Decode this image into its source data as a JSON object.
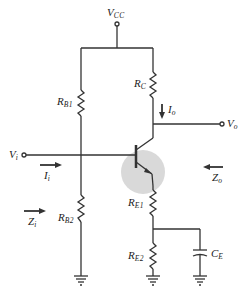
{
  "diagram": {
    "labels": {
      "vcc": {
        "main": "V",
        "sub": "CC"
      },
      "rb1": {
        "main": "R",
        "sub": "B1"
      },
      "rb2": {
        "main": "R",
        "sub": "B2"
      },
      "rc": {
        "main": "R",
        "sub": "C"
      },
      "re1": {
        "main": "R",
        "sub": "E1"
      },
      "re2": {
        "main": "R",
        "sub": "E2"
      },
      "ce": {
        "main": "C",
        "sub": "E"
      },
      "vi": {
        "main": "V",
        "sub": "i"
      },
      "vo": {
        "main": "V",
        "sub": "o"
      },
      "ii": {
        "main": "I",
        "sub": "i"
      },
      "io": {
        "main": "I",
        "sub": "o"
      },
      "zi": {
        "main": "Z",
        "sub": "i"
      },
      "zo": {
        "main": "Z",
        "sub": "o"
      }
    },
    "colors": {
      "wire": "#333333",
      "transistor_highlight": "#d9d9d9"
    }
  }
}
